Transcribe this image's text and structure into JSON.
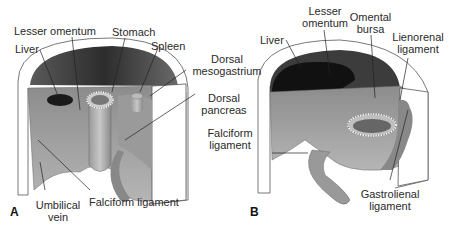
{
  "figure": {
    "panels": [
      {
        "letter": "A",
        "labels": {
          "liver": "Liver",
          "lesser_omentum": "Lesser omentum",
          "stomach": "Stomach",
          "spleen": "Spleen",
          "dorsal_mesogastrium_1": "Dorsal",
          "dorsal_mesogastrium_2": "mesogastrium",
          "dorsal_pancreas_1": "Dorsal",
          "dorsal_pancreas_2": "pancreas",
          "umbilical_vein_1": "Umbilical",
          "umbilical_vein_2": "vein",
          "falciform_ligament": "Falciform ligament"
        }
      },
      {
        "letter": "B",
        "labels": {
          "liver": "Liver",
          "lesser_omentum_1": "Lesser",
          "lesser_omentum_2": "omentum",
          "omental_bursa_1": "Omental",
          "omental_bursa_2": "bursa",
          "lienorenal_ligament_1": "Lienorenal",
          "lienorenal_ligament_2": "ligament",
          "falciform_ligament_1": "Falciform",
          "falciform_ligament_2": "ligament",
          "gastrolienal_ligament_1": "Gastrolienal",
          "gastrolienal_ligament_2": "ligament"
        }
      }
    ]
  }
}
